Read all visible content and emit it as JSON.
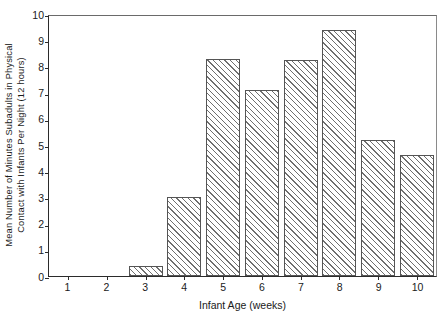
{
  "chart_data": {
    "type": "bar",
    "title": "",
    "subtitle": "",
    "xlabel": "Infant Age (weeks)",
    "ylabel_line1": "Mean Number of Minutes Subadults in Physical",
    "ylabel_line2": "Contact with Infants Per Night (12 hours)",
    "ylabel": "Mean Number of Minutes Subadults in Physical Contact with Infants Per Night (12 hours)",
    "categories": [
      "1",
      "2",
      "3",
      "4",
      "5",
      "6",
      "7",
      "8",
      "9",
      "10"
    ],
    "values": [
      0,
      0,
      0.4,
      3.05,
      8.35,
      7.15,
      8.3,
      9.45,
      5.25,
      4.65
    ],
    "ylim": [
      0,
      10
    ],
    "yticks": [
      "0",
      "1",
      "2",
      "3",
      "4",
      "5",
      "6",
      "7",
      "8",
      "9",
      "10"
    ],
    "ytick_values": [
      0,
      1,
      2,
      3,
      4,
      5,
      6,
      7,
      8,
      9,
      10
    ],
    "xticks": [
      "1",
      "2",
      "3",
      "4",
      "5",
      "6",
      "7",
      "8",
      "9",
      "10"
    ],
    "grid": false,
    "legend": false,
    "legend_position": "none",
    "bar_fill": "hatched-diagonal",
    "bar_edge_color": "#555555",
    "hatch_color": "#6f6f6f",
    "axis_color": "#2b2b2b",
    "background_color": "#ffffff"
  }
}
